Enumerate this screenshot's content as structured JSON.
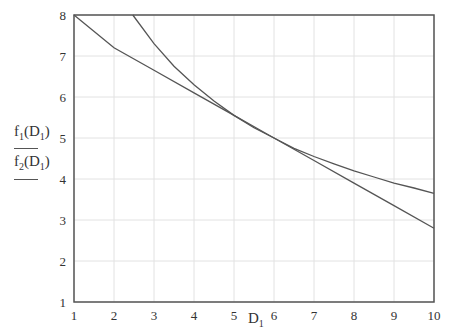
{
  "chart_data": {
    "type": "line",
    "title": "",
    "xlabel": "D1",
    "ylabel": [
      "f1(D1)",
      "f2(D1)"
    ],
    "xlim": [
      1,
      10
    ],
    "ylim": [
      1,
      8
    ],
    "grid": true,
    "x_ticks": [
      1,
      2,
      3,
      4,
      5,
      6,
      7,
      8,
      9,
      10
    ],
    "y_ticks": [
      1,
      2,
      3,
      4,
      5,
      6,
      7,
      8
    ],
    "series": [
      {
        "name": "f1(D1)",
        "x": [
          2.47,
          3,
          3.5,
          4,
          4.5,
          5,
          5.5,
          6,
          6.5,
          7,
          7.5,
          8,
          8.5,
          9,
          9.5,
          10
        ],
        "values": [
          8.0,
          7.3,
          6.75,
          6.3,
          5.9,
          5.55,
          5.25,
          5.0,
          4.75,
          4.55,
          4.37,
          4.2,
          4.05,
          3.9,
          3.78,
          3.65
        ]
      },
      {
        "name": "f2(D1)",
        "x": [
          1,
          2,
          3,
          4,
          5,
          6,
          7,
          8,
          9,
          10
        ],
        "values": [
          8.0,
          7.2,
          6.65,
          6.1,
          5.55,
          5.0,
          4.45,
          3.9,
          3.35,
          2.8
        ]
      }
    ]
  },
  "labels": {
    "xlabel_main": "D",
    "xlabel_sub": "1",
    "f1": "f",
    "f1_sub": "1",
    "f2": "f",
    "f2_sub": "2",
    "arg": "D",
    "arg_sub": "1"
  }
}
